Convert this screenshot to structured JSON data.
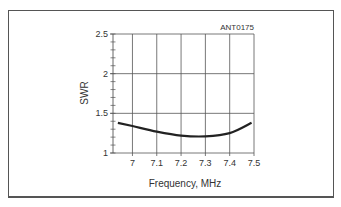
{
  "figure": {
    "id_label": "ANT0175"
  },
  "chart_data": {
    "type": "line",
    "title": "",
    "annotation": "ANT0175",
    "xlabel": "Frequency, MHz",
    "ylabel": "SWR",
    "xlim": [
      6.92,
      7.5
    ],
    "ylim": [
      1,
      2.5
    ],
    "x_ticks": [
      "7",
      "7.1",
      "7.2",
      "7.3",
      "7.4",
      "7.5"
    ],
    "y_ticks": [
      "1",
      "1.5",
      "2",
      "2.5"
    ],
    "y_minor_step": 0.1,
    "grid": true,
    "legend": null,
    "series": [
      {
        "name": "SWR",
        "x": [
          6.94,
          7.0,
          7.1,
          7.2,
          7.3,
          7.4,
          7.49
        ],
        "values": [
          1.38,
          1.34,
          1.27,
          1.22,
          1.21,
          1.25,
          1.38
        ]
      }
    ]
  }
}
